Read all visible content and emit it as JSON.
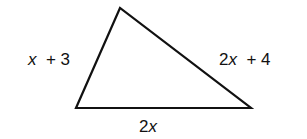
{
  "diagram": {
    "type": "triangle",
    "vertices": {
      "top": [
        120,
        8
      ],
      "bottom_left": [
        76,
        108
      ],
      "bottom_right": [
        251,
        108
      ]
    },
    "stroke_color": "#111111",
    "labels": {
      "left_side": {
        "var": "x",
        "rest": "  + 3"
      },
      "right_side": {
        "var": "2x",
        "rest": "  + 4"
      },
      "bottom_side": {
        "var": "2x",
        "rest": ""
      }
    }
  }
}
